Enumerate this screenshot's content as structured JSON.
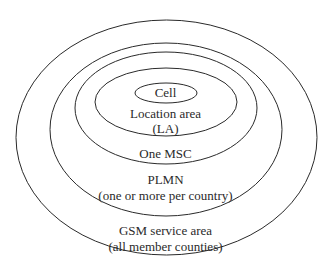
{
  "diagram": {
    "type": "nested-ellipses",
    "stroke_color": "#2a2a2a",
    "background": "#ffffff",
    "levels": [
      {
        "id": "cell",
        "lines": [
          "Cell"
        ]
      },
      {
        "id": "location-area",
        "lines": [
          "Location area",
          "(LA)"
        ]
      },
      {
        "id": "msc",
        "lines": [
          "One MSC"
        ]
      },
      {
        "id": "plmn",
        "lines": [
          "PLMN",
          "(one or more per country)"
        ]
      },
      {
        "id": "gsm-service-area",
        "lines": [
          "GSM service area",
          "(all member counties)"
        ]
      }
    ]
  }
}
